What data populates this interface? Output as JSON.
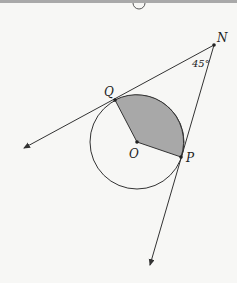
{
  "figure": {
    "points": {
      "N": {
        "label": "N",
        "x": 214,
        "y": 45
      },
      "Q": {
        "label": "Q",
        "x": 115,
        "y": 100
      },
      "O": {
        "label": "O",
        "x": 137,
        "y": 142
      },
      "P": {
        "label": "P",
        "x": 181,
        "y": 157
      }
    },
    "angle_label": "45°",
    "circle": {
      "center": "O",
      "radius": 47
    },
    "shaded_sector": {
      "from": "Q",
      "to": "P",
      "fill": "#a8a8a8"
    },
    "colors": {
      "line": "#333333",
      "background": "#f7f7f5",
      "shade": "#a8a8a8"
    }
  }
}
